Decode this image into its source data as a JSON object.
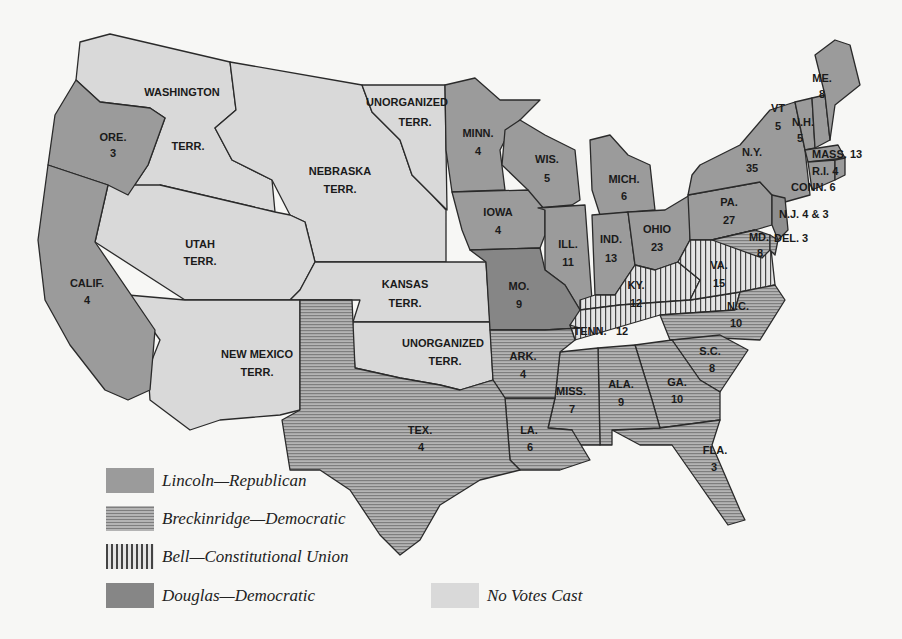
{
  "colors": {
    "background": "#f7f7f5",
    "lincoln": "#9b9b9b",
    "breckinridge": "#a3a3a3",
    "bell": "#e2e2e2",
    "douglas": "#868686",
    "no_votes": "#d9d9d9",
    "border": "#2a2a2a"
  },
  "legend": {
    "items": [
      {
        "key": "lincoln",
        "label": "Lincoln—Republican",
        "pattern": "solid"
      },
      {
        "key": "breckinridge",
        "label": "Breckinridge—Democratic",
        "pattern": "horizontal-stripes"
      },
      {
        "key": "bell",
        "label": "Bell—Constitutional Union",
        "pattern": "vertical-stripes"
      },
      {
        "key": "douglas",
        "label": "Douglas—Democratic",
        "pattern": "solid-dark"
      },
      {
        "key": "no_votes",
        "label": "No Votes Cast",
        "pattern": "solid-light"
      }
    ]
  },
  "territories": [
    {
      "name": "WASHINGTON",
      "line2": "TERR."
    },
    {
      "name": "NEBRASKA",
      "line2": "TERR."
    },
    {
      "name": "UNORGANIZED",
      "line2": "TERR."
    },
    {
      "name": "UTAH",
      "line2": "TERR."
    },
    {
      "name": "KANSAS",
      "line2": "TERR."
    },
    {
      "name": "NEW MEXICO",
      "line2": "TERR."
    },
    {
      "name": "UNORGANIZED",
      "line2": "TERR."
    }
  ],
  "states": [
    {
      "abbr": "ORE.",
      "votes": "3",
      "winner": "lincoln"
    },
    {
      "abbr": "CALIF.",
      "votes": "4",
      "winner": "lincoln"
    },
    {
      "abbr": "MINN.",
      "votes": "4",
      "winner": "lincoln"
    },
    {
      "abbr": "IOWA",
      "votes": "4",
      "winner": "lincoln"
    },
    {
      "abbr": "WIS.",
      "votes": "5",
      "winner": "lincoln"
    },
    {
      "abbr": "ILL.",
      "votes": "11",
      "winner": "lincoln"
    },
    {
      "abbr": "MICH.",
      "votes": "6",
      "winner": "lincoln"
    },
    {
      "abbr": "IND.",
      "votes": "13",
      "winner": "lincoln"
    },
    {
      "abbr": "OHIO",
      "votes": "23",
      "winner": "lincoln"
    },
    {
      "abbr": "PA.",
      "votes": "27",
      "winner": "lincoln"
    },
    {
      "abbr": "N.Y.",
      "votes": "35",
      "winner": "lincoln"
    },
    {
      "abbr": "VT",
      "votes": "5",
      "winner": "lincoln"
    },
    {
      "abbr": "N.H.",
      "votes": "5",
      "winner": "lincoln"
    },
    {
      "abbr": "ME.",
      "votes": "8",
      "winner": "lincoln"
    },
    {
      "abbr": "MASS. 13",
      "votes": "13",
      "winner": "lincoln"
    },
    {
      "abbr": "R.I. 4",
      "votes": "4",
      "winner": "lincoln"
    },
    {
      "abbr": "CONN. 6",
      "votes": "6",
      "winner": "lincoln"
    },
    {
      "abbr": "N.J. 4 & 3",
      "votes": "4 & 3",
      "winner": "lincoln/douglas"
    },
    {
      "abbr": "MO.",
      "votes": "9",
      "winner": "douglas"
    },
    {
      "abbr": "KY.",
      "votes": "12",
      "winner": "bell"
    },
    {
      "abbr": "VA.",
      "votes": "15",
      "winner": "bell"
    },
    {
      "abbr": "TENN.",
      "votes": "12",
      "winner": "bell"
    },
    {
      "abbr": "MD.",
      "votes": "8",
      "winner": "breckinridge"
    },
    {
      "abbr": "DEL. 3",
      "votes": "3",
      "winner": "breckinridge"
    },
    {
      "abbr": "N.C.",
      "votes": "10",
      "winner": "breckinridge"
    },
    {
      "abbr": "S.C.",
      "votes": "8",
      "winner": "breckinridge"
    },
    {
      "abbr": "GA.",
      "votes": "10",
      "winner": "breckinridge"
    },
    {
      "abbr": "ALA.",
      "votes": "9",
      "winner": "breckinridge"
    },
    {
      "abbr": "MISS.",
      "votes": "7",
      "winner": "breckinridge"
    },
    {
      "abbr": "LA.",
      "votes": "6",
      "winner": "breckinridge"
    },
    {
      "abbr": "ARK.",
      "votes": "4",
      "winner": "breckinridge"
    },
    {
      "abbr": "TEX.",
      "votes": "4",
      "winner": "breckinridge"
    },
    {
      "abbr": "FLA.",
      "votes": "3",
      "winner": "breckinridge"
    }
  ]
}
